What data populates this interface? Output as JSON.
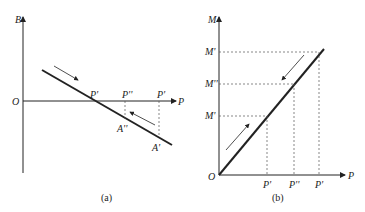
{
  "panel_a": {
    "caption": "(a)",
    "y_axis_label": "B",
    "x_axis_label": "P",
    "origin_label": "O",
    "points": {
      "zero_cross": "P'",
      "p_double": "P''",
      "p_prime": "P'",
      "a_double": "A''",
      "a_prime": "A'"
    }
  },
  "panel_b": {
    "caption": "(b)",
    "y_axis_label": "M",
    "x_axis_label": "P",
    "origin_label": "O",
    "y_ticks": [
      "M'",
      "M''",
      "M'"
    ],
    "x_ticks": [
      "P'",
      "P''",
      "P'"
    ]
  },
  "colors": {
    "line": "#222222",
    "dashed": "#555555"
  }
}
